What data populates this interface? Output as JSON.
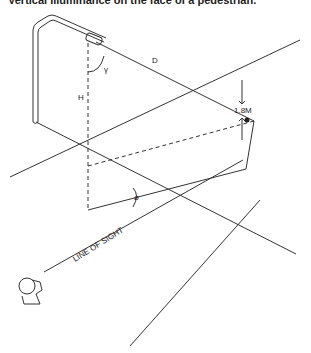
{
  "caption": "Vertical illuminance on the face of a pedestrian.",
  "labels": {
    "distance": "D",
    "angle_gamma": "γ",
    "height": "H",
    "face_height": "1.8M",
    "angle_phi": "ø",
    "line_of_sight": "LINE OF SIGHT"
  },
  "colors": {
    "stroke": "#333333",
    "background": "#ffffff"
  }
}
